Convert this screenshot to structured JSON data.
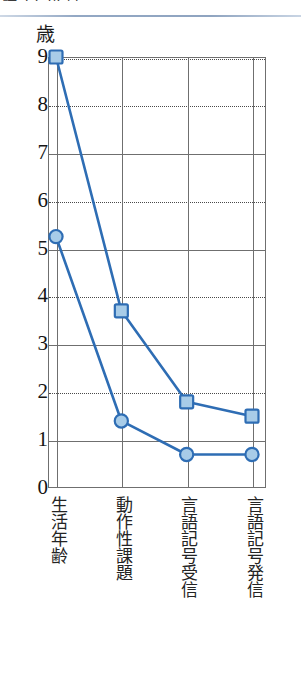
{
  "page": {
    "clipped_heading_text": "語 12 か 月。",
    "unit_label": "歳"
  },
  "chart_data": {
    "type": "line",
    "title": "",
    "xlabel": "",
    "ylabel": "歳",
    "ylim": [
      0,
      9
    ],
    "yticks": [
      0,
      1,
      2,
      3,
      4,
      5,
      6,
      7,
      8,
      9
    ],
    "ytick_labels": [
      "0",
      "1",
      "2",
      "3",
      "4",
      "5",
      "6",
      "7",
      "8",
      "9"
    ],
    "grid": {
      "horizontal": true,
      "vertical": true,
      "solid_values": [
        1,
        3,
        5,
        7,
        9
      ],
      "dotted_values": [
        2,
        4,
        6,
        8
      ]
    },
    "legend": "none",
    "categories": [
      "生活年齢",
      "動作性課題",
      "言語記号受信",
      "言語記号発信"
    ],
    "series": [
      {
        "name": "上位系列",
        "marker": "square",
        "values": [
          9.0,
          3.7,
          1.8,
          1.5
        ],
        "line_color": "#2E6DB4",
        "marker_fill": "#A8CCE8",
        "marker_stroke": "#2E6DB4"
      },
      {
        "name": "下位系列",
        "marker": "circle",
        "values": [
          5.25,
          1.4,
          0.7,
          0.7
        ],
        "line_color": "#2E6DB4",
        "marker_fill": "#A8CCE8",
        "marker_stroke": "#2E6DB4"
      }
    ]
  },
  "colors": {
    "line": "#2E6DB4",
    "marker_fill": "#A8CCE8",
    "frame": "#6F6F6F",
    "rule": "#8FA4C0"
  }
}
